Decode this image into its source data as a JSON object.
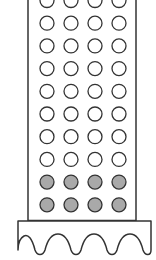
{
  "diagram": {
    "colors": {
      "stroke": "#333333",
      "empty_fill": "#ffffff",
      "filled_fill": "#a9a9a9",
      "background": "#ffffff"
    },
    "grid": {
      "columns": 4,
      "rows": 10,
      "empty_rows": 8,
      "filled_rows": 2,
      "total_circles": 40,
      "filled_circles": 8
    },
    "base": {
      "waves": 4
    }
  }
}
